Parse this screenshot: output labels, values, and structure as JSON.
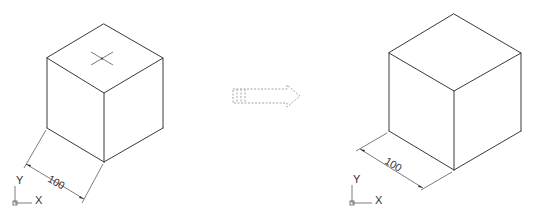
{
  "figure": {
    "colors": {
      "line": "#3a3a3a",
      "dimension": "#5a5a5a",
      "arrow": "#9a9a9a",
      "background": "#ffffff"
    }
  },
  "left_view": {
    "dimension_label": "100",
    "ucs": {
      "y_label": "Y",
      "x_label": "X"
    },
    "has_center_cross": true
  },
  "transition_arrow": {
    "icon": "dashed-right-arrow-icon"
  },
  "right_view": {
    "dimension_label": "100",
    "ucs": {
      "y_label": "Y",
      "x_label": "X"
    },
    "has_center_cross": false
  }
}
